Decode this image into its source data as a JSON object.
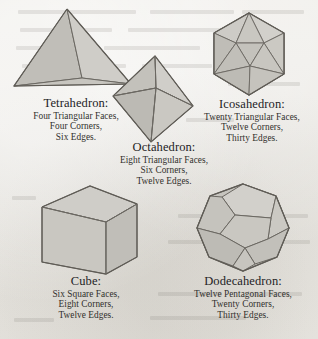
{
  "page": {
    "kind": "platonic-solids-plate",
    "background_color": "#e9e7e2",
    "ink_color": "#2b2b2b"
  },
  "style": {
    "face_light": "#d2d0cb",
    "face_mid": "#c4c2bc",
    "face_dark": "#b6b4ae",
    "edge_color": "#6b6862"
  },
  "solids": [
    {
      "id": "tetrahedron",
      "name": "Tetrahedron:",
      "facts": [
        "Four Triangular Faces,",
        "Four Corners,",
        "Six Edges."
      ],
      "faces": 4,
      "face_shape": "triangle",
      "corners": 4,
      "edges": 6
    },
    {
      "id": "octahedron",
      "name": "Octahedron:",
      "facts": [
        "Eight Triangular Faces,",
        "Six Corners,",
        "Twelve Edges."
      ],
      "faces": 8,
      "face_shape": "triangle",
      "corners": 6,
      "edges": 12
    },
    {
      "id": "icosahedron",
      "name": "Icosahedron:",
      "facts": [
        "Twenty Triangular Faces,",
        "Twelve Corners,",
        "Thirty Edges."
      ],
      "faces": 20,
      "face_shape": "triangle",
      "corners": 12,
      "edges": 30
    },
    {
      "id": "cube",
      "name": "Cube:",
      "facts": [
        "Six Square Faces,",
        "Eight Corners,",
        "Twelve Edges."
      ],
      "faces": 6,
      "face_shape": "square",
      "corners": 8,
      "edges": 12
    },
    {
      "id": "dodecahedron",
      "name": "Dodecahedron:",
      "facts": [
        "Twelve Pentagonal Faces,",
        "Twenty Corners,",
        "Thirty Edges."
      ],
      "faces": 12,
      "face_shape": "pentagon",
      "corners": 20,
      "edges": 30
    }
  ]
}
